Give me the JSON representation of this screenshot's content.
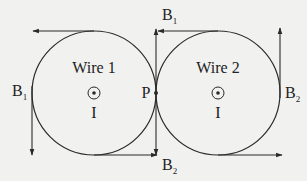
{
  "diagram": {
    "wire1": {
      "label": "Wire 1",
      "current": "I",
      "symbol": "current-out-of-page"
    },
    "wire2": {
      "label": "Wire 2",
      "current": "I",
      "symbol": "current-out-of-page"
    },
    "point": {
      "label": "P"
    },
    "field_labels": {
      "b1_left": {
        "main": "B",
        "sub": "1"
      },
      "b1_top": {
        "main": "B",
        "sub": "1"
      },
      "b2_bottom": {
        "main": "B",
        "sub": "2"
      },
      "b2_right": {
        "main": "B",
        "sub": "2"
      }
    },
    "colors": {
      "line": "#2a2a2a",
      "background": "#f1f1f0"
    }
  }
}
